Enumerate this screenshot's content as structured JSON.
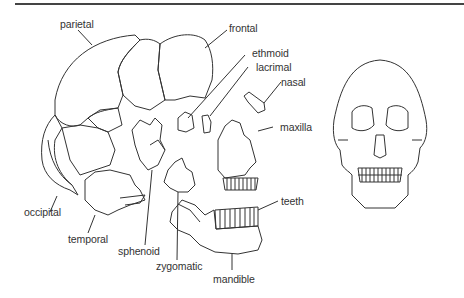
{
  "figure": {
    "labels": {
      "parietal": "parietal",
      "frontal": "frontal",
      "ethmoid": "ethmoid",
      "lacrimal": "lacrimal",
      "nasal": "nasal",
      "maxilla": "maxilla",
      "teeth": "teeth",
      "occipital": "occipital",
      "temporal": "temporal",
      "sphenoid": "sphenoid",
      "zygomatic": "zygomatic",
      "mandible": "mandible"
    },
    "colors": {
      "line": "#333333",
      "background": "#ffffff"
    }
  }
}
